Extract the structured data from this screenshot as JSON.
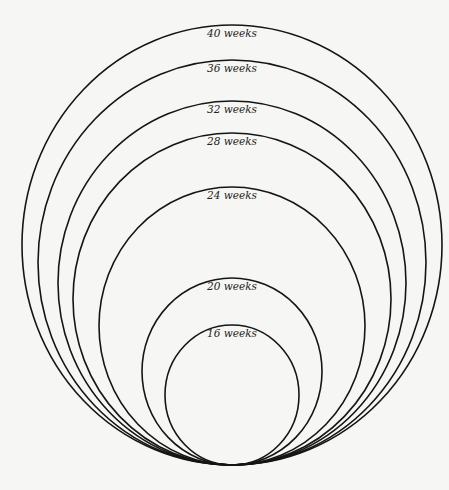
{
  "figure": {
    "title": "",
    "background": "#f6f6f4",
    "stroke": "#151515",
    "center_x": 232,
    "bottom_y": 465,
    "rings": [
      {
        "label": "40 weeks",
        "ry": 220,
        "rx": 210
      },
      {
        "label": "36 weeks",
        "ry": 202.5,
        "rx": 194
      },
      {
        "label": "32 weeks",
        "ry": 182,
        "rx": 174
      },
      {
        "label": "28 weeks",
        "ry": 166,
        "rx": 159
      },
      {
        "label": "24 weeks",
        "ry": 139,
        "rx": 133
      },
      {
        "label": "20 weeks",
        "ry": 93.5,
        "rx": 90
      },
      {
        "label": "16 weeks",
        "ry": 70,
        "rx": 67
      }
    ]
  }
}
